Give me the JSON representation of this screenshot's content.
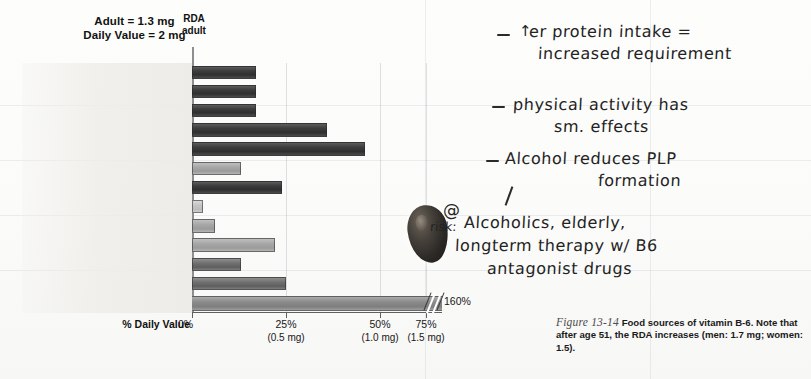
{
  "figure": {
    "title_lines": [
      "Adult = 1.3 mg",
      "Daily Value = 2 mg"
    ],
    "rda_label_line1": "RDA",
    "rda_label_line2": "adult",
    "axis_title": "% Daily Value",
    "break_value": "160%",
    "caption_number": "Figure 13-14",
    "caption_text": " Food sources of vitamin B-6. Note that after age 51, the RDA increases (men: 1.7 mg; women: 1.5)."
  },
  "chart_data": {
    "type": "bar",
    "title": "Food sources of vitamin B-6",
    "xlabel": "% Daily Value",
    "ylabel": "",
    "xlim": [
      0,
      75
    ],
    "orientation": "horizontal",
    "grid": true,
    "legend": "none",
    "tick_labels": [
      "0%",
      "25%",
      "50%",
      "75%"
    ],
    "tick_sublabels": [
      "",
      "(0.5 mg)",
      "(1.0 mg)",
      "(1.5 mg)"
    ],
    "tick_values": [
      0,
      25,
      50,
      75
    ],
    "annotations": [
      "Adult = 1.3 mg",
      "Daily Value = 2 mg",
      "RDA adult",
      "160%"
    ],
    "categories": [
      "Tuna, 3 oz",
      "Turkey nuggets, 3 oz",
      "Beef, 3 oz",
      "Pistachios, 2 oz",
      "Pinto beans, 1 cup",
      "Feta cheese, 2 oz",
      "Banana, ½ cup",
      "Green peppers, ½ cup",
      "Sweet potato, ½ cup",
      "Potato, ½ cup",
      "Bagel, 4–inch",
      "Frosted Flakes® cereal, ¾ cup",
      "Oatmeal, ¾ cup"
    ],
    "values": [
      17,
      17,
      17,
      36,
      46,
      13,
      24,
      3,
      6,
      22,
      13,
      25,
      160
    ],
    "shades": [
      "dark",
      "dark",
      "dark",
      "dark",
      "dark",
      "light",
      "dark",
      "pale",
      "light",
      "light",
      "mid",
      "mid",
      "mid"
    ],
    "broken_bar_index": 12
  },
  "handwriting": {
    "note1_line1": "er protein intake =",
    "note1_line2": "increased requirement",
    "note2_line1": "physical activity has",
    "note2_line2": "sm. effects",
    "note3_line1": "Alcohol reduces PLP",
    "note3_line2": "formation",
    "note4_at": "@",
    "note4_risk": "risk:",
    "note4_line1": "Alcoholics, elderly,",
    "note4_line2": "longterm therapy w/ B6",
    "note4_line3": "antagonist drugs",
    "up_arrow": "↑"
  }
}
